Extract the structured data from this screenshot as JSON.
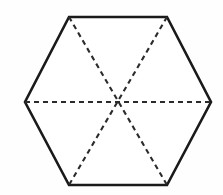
{
  "figure": {
    "shape_name": "hexagon",
    "canvas": {
      "width": 223,
      "height": 195,
      "background_color": "#fefefe"
    },
    "outline": {
      "style": "solid",
      "stroke_color": "#1a1a1a",
      "stroke_width": 2.6,
      "fill_color": "#ffffff",
      "points": "69,17 167,17 211,102 167,185 69,185 25,102"
    },
    "center_point": {
      "label": "center",
      "x": 118,
      "y": 102
    },
    "vertices": [
      {
        "name": "top-left",
        "x": 69,
        "y": 17
      },
      {
        "name": "top-right",
        "x": 167,
        "y": 17
      },
      {
        "name": "right",
        "x": 211,
        "y": 102
      },
      {
        "name": "bottom-right",
        "x": 167,
        "y": 185
      },
      {
        "name": "bottom-left",
        "x": 69,
        "y": 185
      },
      {
        "name": "left",
        "x": 25,
        "y": 102
      }
    ],
    "diagonals": {
      "style": "dashed",
      "stroke_color": "#2b2b2b",
      "stroke_width": 2.1,
      "dash_pattern": "5 4",
      "lines": [
        {
          "name": "horizontal-diagonal",
          "from": "left",
          "to": "right",
          "x1": 25,
          "y1": 102,
          "x2": 211,
          "y2": 102
        },
        {
          "name": "top-left-to-bottom-right-diagonal",
          "from": "top-left",
          "to": "bottom-right",
          "x1": 69,
          "y1": 17,
          "x2": 167,
          "y2": 185
        },
        {
          "name": "top-right-to-bottom-left-diagonal",
          "from": "top-right",
          "to": "bottom-left",
          "x1": 167,
          "y1": 17,
          "x2": 69,
          "y2": 185
        }
      ]
    }
  }
}
